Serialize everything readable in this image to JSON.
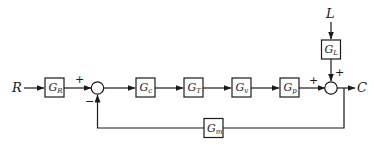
{
  "diagram": {
    "type": "feedback-control-block-diagram",
    "signals": {
      "input": "R",
      "output": "C",
      "disturbance": "L"
    },
    "blocks": [
      {
        "id": "GR",
        "main": "G",
        "sub": "R"
      },
      {
        "id": "Gc",
        "main": "G",
        "sub": "c"
      },
      {
        "id": "GT",
        "main": "G",
        "sub": "T"
      },
      {
        "id": "Gv",
        "main": "G",
        "sub": "v"
      },
      {
        "id": "Gp",
        "main": "G",
        "sub": "p"
      },
      {
        "id": "GL",
        "main": "G",
        "sub": "L"
      },
      {
        "id": "Gm",
        "main": "G",
        "sub": "m"
      }
    ],
    "junctions": {
      "sum1": {
        "plus": "+",
        "minus": "−"
      },
      "sum2": {
        "plus_left": "+",
        "plus_top": "+"
      }
    }
  }
}
